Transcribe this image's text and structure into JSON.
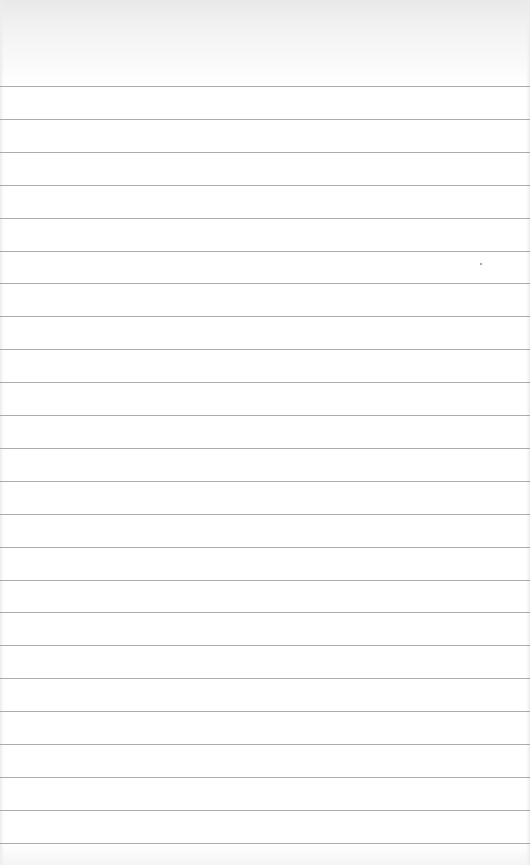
{
  "image": {
    "description": "Blank sheet of lined notebook paper",
    "background_color": "#ffffff",
    "rule_color": "#9c9c9c",
    "rule_count": 24,
    "first_rule_y": 86,
    "rule_spacing_px": 32.9,
    "specks": [
      {
        "x": 480,
        "y": 263
      }
    ]
  }
}
